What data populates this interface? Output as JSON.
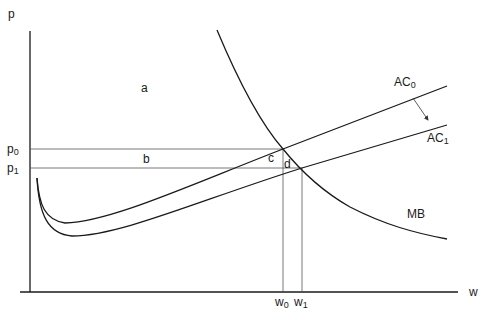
{
  "diagram": {
    "type": "economics-cost-benefit",
    "axes": {
      "y_label": "p",
      "x_label": "w"
    },
    "price_levels": [
      {
        "label": "p",
        "sub": "0"
      },
      {
        "label": "p",
        "sub": "1"
      }
    ],
    "quantity_levels": [
      {
        "label": "w",
        "sub": "0"
      },
      {
        "label": "w",
        "sub": "1"
      }
    ],
    "curves": [
      {
        "label": "AC",
        "sub": "0",
        "description": "average cost before shift"
      },
      {
        "label": "AC",
        "sub": "1",
        "description": "average cost after shift"
      },
      {
        "label": "MB",
        "sub": "",
        "description": "marginal benefit (downward sloping)"
      }
    ],
    "regions": [
      "a",
      "b",
      "c",
      "d"
    ],
    "annotations": [
      "arrow from AC0 to AC1 indicating downward shift"
    ],
    "colors": {
      "curve": "#1a1a1a",
      "guide": "#555555",
      "background": "#ffffff"
    }
  }
}
